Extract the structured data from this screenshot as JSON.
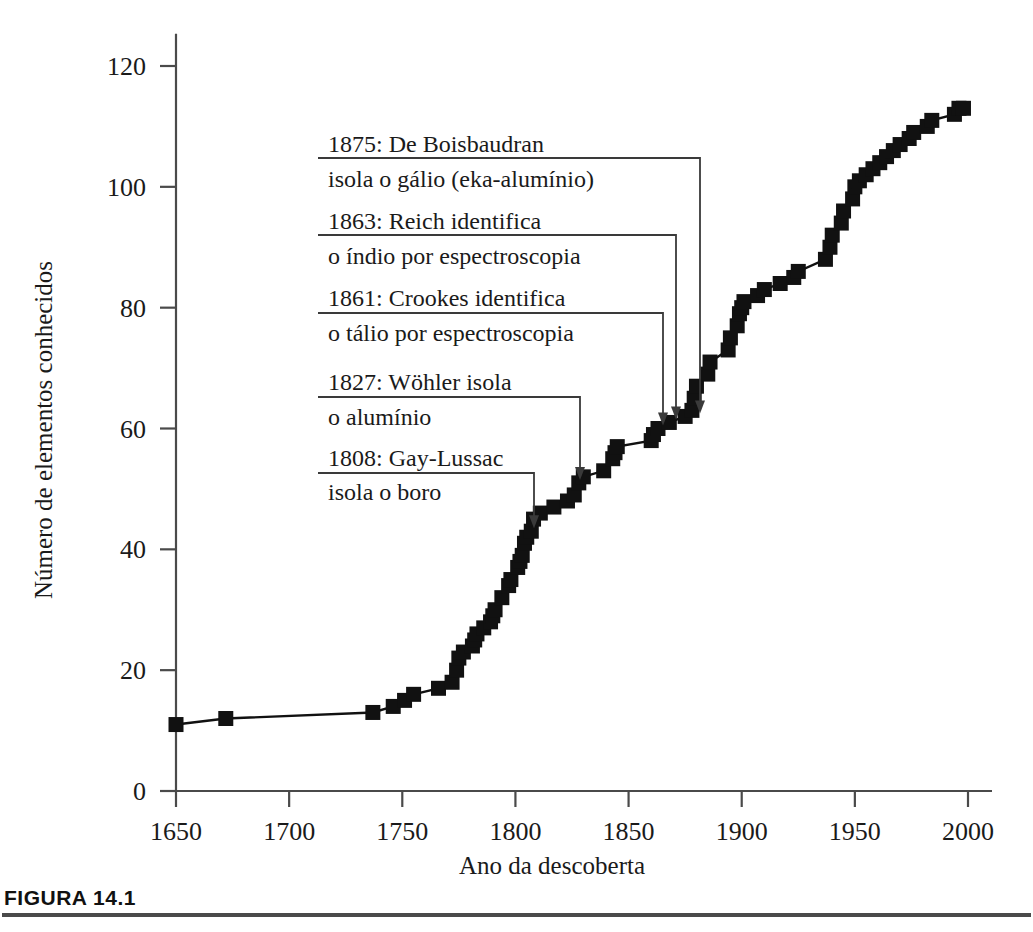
{
  "figure": {
    "caption_label": "FIGURA 14.1"
  },
  "chart_data": {
    "type": "line",
    "title": "",
    "subtitle": "",
    "xlabel": "Ano da descoberta",
    "ylabel": "Número de elementos conhecidos",
    "xlim": [
      1640,
      2010
    ],
    "ylim": [
      0,
      125
    ],
    "grid": false,
    "legend": "none",
    "marker": "filled-square",
    "xticks": [
      1650,
      1700,
      1750,
      1800,
      1850,
      1900,
      1950,
      2000
    ],
    "xticklabels": [
      "1650",
      "1700",
      "1750",
      "1800",
      "1850",
      "1900",
      "1950",
      "2000"
    ],
    "yticks": [
      0,
      20,
      40,
      60,
      80,
      100,
      120
    ],
    "yticklabels": [
      "0",
      "20",
      "40",
      "60",
      "80",
      "100",
      "120"
    ],
    "series": [
      {
        "name": "Número de elementos conhecidos",
        "x": [
          1650,
          1672,
          1737,
          1746,
          1751,
          1755,
          1766,
          1772,
          1774,
          1775,
          1777,
          1781,
          1782,
          1783,
          1786,
          1789,
          1790,
          1791,
          1794,
          1797,
          1798,
          1801,
          1802,
          1803,
          1804,
          1805,
          1807,
          1808,
          1811,
          1817,
          1823,
          1826,
          1828,
          1830,
          1839,
          1843,
          1844,
          1845,
          1860,
          1861,
          1863,
          1868,
          1875,
          1878,
          1879,
          1880,
          1885,
          1886,
          1894,
          1895,
          1898,
          1899,
          1900,
          1901,
          1907,
          1910,
          1917,
          1923,
          1925,
          1937,
          1939,
          1940,
          1944,
          1945,
          1949,
          1950,
          1952,
          1955,
          1958,
          1961,
          1964,
          1967,
          1970,
          1974,
          1976,
          1982,
          1984,
          1994,
          1996,
          1998
        ],
        "y": [
          11,
          12,
          13,
          14,
          15,
          16,
          17,
          18,
          20,
          22,
          23,
          24,
          25,
          26,
          27,
          28,
          29,
          30,
          32,
          34,
          35,
          37,
          38,
          39,
          41,
          42,
          43,
          45,
          46,
          47,
          48,
          49,
          51,
          52,
          53,
          55,
          56,
          57,
          58,
          59,
          60,
          61,
          62,
          63,
          65,
          67,
          69,
          71,
          73,
          75,
          77,
          79,
          80,
          81,
          82,
          83,
          84,
          85,
          86,
          88,
          90,
          92,
          94,
          96,
          98,
          100,
          101,
          102,
          103,
          104,
          105,
          106,
          107,
          108,
          109,
          110,
          111,
          112,
          113,
          113
        ]
      }
    ],
    "annotations": [
      {
        "id": "1875-boisbaudran",
        "line1": "1875: De Boisbaudran",
        "line2": "isola o gálio (eka-alumínio)",
        "target_year": 1885,
        "target_value": 62
      },
      {
        "id": "1863-reich",
        "line1": "1863: Reich identifica",
        "line2": "o índio por espectroscopia",
        "target_year": 1874,
        "target_value": 61
      },
      {
        "id": "1861-crookes",
        "line1": "1861: Crookes identifica",
        "line2": "o tálio por espectroscopia",
        "target_year": 1869,
        "target_value": 60
      },
      {
        "id": "1827-wohler",
        "line1": "1827: Wöhler isola",
        "line2": "o alumínio",
        "target_year": 1832,
        "target_value": 51
      },
      {
        "id": "1808-gay-lussac",
        "line1": "1808: Gay-Lussac",
        "line2": "isola o boro",
        "target_year": 1814,
        "target_value": 43
      }
    ]
  }
}
